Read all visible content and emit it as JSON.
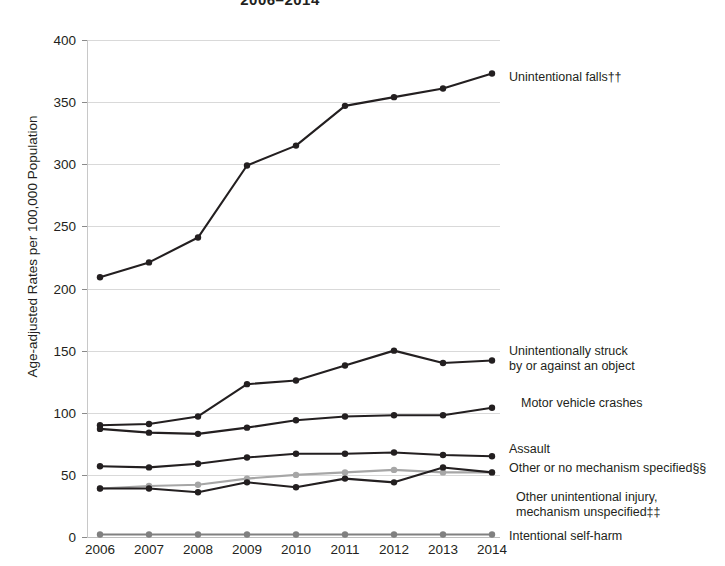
{
  "chart_data": {
    "type": "line",
    "title": "2006–2014",
    "xlabel": "",
    "ylabel": "Age-adjusted Rates per 100,000 Population",
    "x": [
      2006,
      2007,
      2008,
      2009,
      2010,
      2011,
      2012,
      2013,
      2014
    ],
    "xtick_labels": [
      "2006",
      "2007",
      "2008",
      "2009",
      "2010",
      "2011",
      "2012",
      "2013",
      "2014"
    ],
    "ytick_labels": [
      "0",
      "50",
      "100",
      "150",
      "200",
      "250",
      "300",
      "350",
      "400"
    ],
    "yticks": [
      0,
      50,
      100,
      150,
      200,
      250,
      300,
      350,
      400
    ],
    "ylim": [
      0,
      400
    ],
    "grid": "horizontal",
    "legend_position": "right-inline",
    "series": [
      {
        "name": "Unintentional falls††",
        "label": "Unintentional falls††",
        "color": "#231f20",
        "values": [
          209,
          221,
          241,
          299,
          315,
          347,
          354,
          361,
          373
        ]
      },
      {
        "name": "Unintentionally struck by or against an object",
        "label": "Unintentionally struck\nby or against an object",
        "color": "#231f20",
        "values": [
          90,
          91,
          97,
          123,
          126,
          138,
          150,
          140,
          142
        ]
      },
      {
        "name": "Motor vehicle crashes",
        "label": "Motor vehicle crashes",
        "color": "#231f20",
        "values": [
          87,
          84,
          83,
          88,
          94,
          97,
          98,
          98,
          104
        ]
      },
      {
        "name": "Assault",
        "label": "Assault",
        "color": "#231f20",
        "values": [
          57,
          56,
          59,
          64,
          67,
          67,
          68,
          66,
          65
        ]
      },
      {
        "name": "Other or no mechanism specified§§",
        "label": "Other or no mechanism specified§§",
        "color": "#a6a6a6",
        "values": [
          39,
          41,
          42,
          47,
          50,
          52,
          54,
          52,
          52
        ]
      },
      {
        "name": "Other unintentional injury, mechanism unspecified‡‡",
        "label": "Other unintentional injury,\nmechanism unspecified‡‡",
        "color": "#231f20",
        "values": [
          39,
          39,
          36,
          44,
          40,
          47,
          44,
          56,
          52
        ]
      },
      {
        "name": "Intentional self-harm",
        "label": "Intentional self-harm",
        "color": "#808080",
        "values": [
          2,
          2,
          2,
          2,
          2,
          2,
          2,
          2,
          2
        ]
      }
    ],
    "legend_entries": [
      {
        "label": "Unintentional falls††",
        "x": 509,
        "y": 70,
        "marker": true,
        "marker_x": 500,
        "marker_y": 75
      },
      {
        "label": "Unintentionally struck\nby or against an object",
        "x": 509,
        "y": 344,
        "marker": true,
        "marker_x": 500,
        "marker_y": 358
      },
      {
        "label": "Motor vehicle crashes",
        "x": 521,
        "y": 396,
        "marker": true,
        "marker_x": 500,
        "marker_y": 402
      },
      {
        "label": "Assault",
        "x": 509,
        "y": 442,
        "marker": true,
        "marker_x": 500,
        "marker_y": 448
      },
      {
        "label": "Other or no mechanism specified§§",
        "x": 509,
        "y": 461,
        "marker": true,
        "marker_x": 500,
        "marker_y": 467
      },
      {
        "label": "Other unintentional injury,\nmechanism unspecified‡‡",
        "x": 516,
        "y": 490,
        "marker": false,
        "marker_x": 500,
        "marker_y": 497
      },
      {
        "label": "Intentional self-harm",
        "x": 509,
        "y": 529,
        "marker": true,
        "marker_x": 500,
        "marker_y": 535
      }
    ]
  }
}
